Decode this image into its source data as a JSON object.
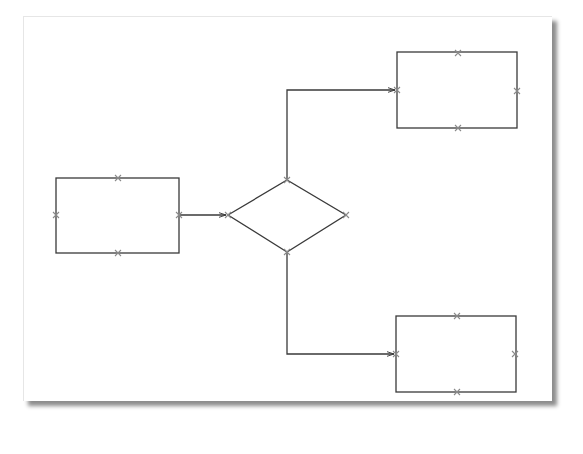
{
  "diagram": {
    "type": "flowchart",
    "page": {
      "x": 23,
      "y": 16,
      "width": 528,
      "height": 384,
      "background": "#ffffff",
      "shadow": true
    },
    "colors": {
      "stroke": "#3a3a3a",
      "connection_point": "#8a8a8a"
    },
    "nodes": [
      {
        "id": "process-left",
        "shape": "rectangle",
        "x": 56,
        "y": 178,
        "width": 123,
        "height": 75,
        "label": ""
      },
      {
        "id": "decision",
        "shape": "diamond",
        "cx": 287,
        "cy": 216,
        "width": 118,
        "height": 72,
        "label": ""
      },
      {
        "id": "process-top-right",
        "shape": "rectangle",
        "x": 397,
        "y": 52,
        "width": 120,
        "height": 76,
        "label": ""
      },
      {
        "id": "process-bottom-right",
        "shape": "rectangle",
        "x": 396,
        "y": 316,
        "width": 120,
        "height": 76,
        "label": ""
      }
    ],
    "edges": [
      {
        "from": "process-left",
        "to": "decision",
        "route": "straight",
        "arrow": true
      },
      {
        "from": "decision",
        "to": "process-top-right",
        "route": "orthogonal",
        "arrow": true
      },
      {
        "from": "decision",
        "to": "process-bottom-right",
        "route": "orthogonal",
        "arrow": true
      }
    ],
    "connection_point_marker": "x-cross"
  }
}
